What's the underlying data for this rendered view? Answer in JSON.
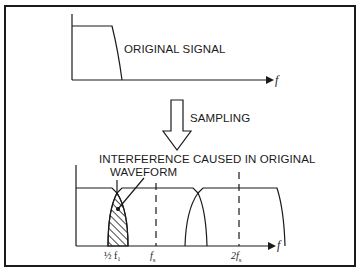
{
  "diagram": {
    "top_plot": {
      "label": "ORIGINAL SIGNAL",
      "axis_label": "f"
    },
    "process": {
      "label": "SAMPLING",
      "arrow_icon": "hollow-down-arrow"
    },
    "bottom_plot": {
      "annotation_line1": "INTERFERENCE CAUSED IN ORIGINAL",
      "annotation_line2": "WAVEFORM",
      "axis_label": "f",
      "ticks": [
        "½ f₁",
        "f",
        "2f"
      ],
      "tick_subscripts": [
        "",
        "s",
        "s"
      ]
    },
    "colors": {
      "ink": "#1a1a1a",
      "background": "#ffffff"
    }
  }
}
